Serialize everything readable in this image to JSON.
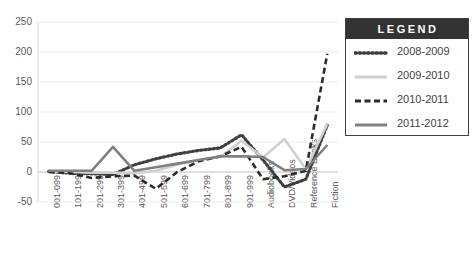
{
  "chart_data": {
    "type": "line",
    "title": "",
    "xlabel": "",
    "ylabel": "",
    "ylim": [
      -50,
      250
    ],
    "ytick_step": 50,
    "yticks": [
      "250",
      "200",
      "150",
      "100",
      "50",
      "0",
      "-50"
    ],
    "grid": true,
    "legend_position": "right",
    "legend_title": "LEGEND",
    "categories": [
      "001-099",
      "101-199",
      "201-299",
      "301-399",
      "401-499",
      "501-599",
      "601-699",
      "701-799",
      "801-899",
      "901-999",
      "Audiobooks",
      "DVD/Videos",
      "Reference Books",
      "Fiction"
    ],
    "series": [
      {
        "name": "2008-2009",
        "color": "#3f3f3f",
        "style": "dotted",
        "values": [
          1,
          -2,
          -3,
          -4,
          12,
          22,
          30,
          36,
          40,
          62,
          20,
          -25,
          -12,
          78
        ]
      },
      {
        "name": "2009-2010",
        "color": "#d0d0d0",
        "style": "solid",
        "values": [
          1,
          0,
          -1,
          -1,
          -2,
          2,
          12,
          20,
          25,
          52,
          24,
          55,
          5,
          80
        ]
      },
      {
        "name": "2010-2011",
        "color": "#2b2b2b",
        "style": "dashed",
        "values": [
          0,
          -2,
          -10,
          -7,
          -6,
          -28,
          0,
          18,
          26,
          42,
          -12,
          -7,
          2,
          197
        ]
      },
      {
        "name": "2011-2012",
        "color": "#808080",
        "style": "solid",
        "values": [
          2,
          2,
          2,
          42,
          2,
          8,
          14,
          20,
          26,
          26,
          25,
          3,
          5,
          45
        ]
      }
    ]
  },
  "layout": {
    "plot": {
      "left": 38,
      "top": 22,
      "width": 300,
      "height": 180
    },
    "legend": {
      "left": 345,
      "top": 18,
      "width": 124,
      "height": 134
    }
  }
}
